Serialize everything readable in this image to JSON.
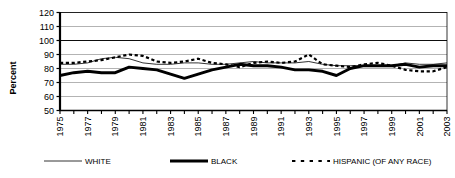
{
  "chart_data": {
    "type": "line",
    "title": "",
    "xlabel": "",
    "ylabel": "Percent",
    "ylim": [
      50,
      120
    ],
    "ytick_step": 10,
    "yticks": [
      "50",
      "60",
      "70",
      "80",
      "90",
      "100",
      "110",
      "120"
    ],
    "xlim": [
      1975,
      2003
    ],
    "xticks_all_years": [
      1975,
      1976,
      1977,
      1978,
      1979,
      1980,
      1981,
      1982,
      1983,
      1984,
      1985,
      1986,
      1987,
      1988,
      1989,
      1990,
      1991,
      1992,
      1993,
      1994,
      1995,
      1996,
      1997,
      1998,
      1999,
      2000,
      2001,
      2002,
      2003
    ],
    "xtick_labels": [
      "1975",
      "1977",
      "1979",
      "1981",
      "1983",
      "1985",
      "1987",
      "1989",
      "1991",
      "1993",
      "1995",
      "1997",
      "1999",
      "2001",
      "2003"
    ],
    "grid": true,
    "grid_axis": "y",
    "legend_position": "bottom",
    "x": [
      1975,
      1976,
      1977,
      1978,
      1979,
      1980,
      1981,
      1982,
      1983,
      1984,
      1985,
      1986,
      1987,
      1988,
      1989,
      1990,
      1991,
      1992,
      1993,
      1994,
      1995,
      1996,
      1997,
      1998,
      1999,
      2000,
      2001,
      2002,
      2003
    ],
    "series": [
      {
        "name": "WHITE",
        "style": "thin-solid",
        "color": "#000000",
        "values": [
          83,
          83,
          84,
          87,
          88,
          87,
          84,
          83,
          83,
          84,
          84,
          83,
          83,
          84,
          85,
          84,
          84,
          84,
          85,
          83,
          82,
          82,
          82,
          82,
          82,
          84,
          83,
          83,
          84
        ]
      },
      {
        "name": "BLACK",
        "style": "thick-solid",
        "color": "#000000",
        "values": [
          75,
          77,
          78,
          77,
          77,
          81,
          80,
          79,
          76,
          73,
          76,
          79,
          81,
          83,
          82,
          82,
          81,
          79,
          79,
          78,
          75,
          80,
          82,
          82,
          82,
          83,
          81,
          82,
          82
        ]
      },
      {
        "name": "HISPANIC (OF ANY RACE)",
        "style": "dashed",
        "color": "#000000",
        "values": [
          84,
          84,
          85,
          86,
          88,
          90,
          89,
          85,
          84,
          85,
          87,
          84,
          83,
          81,
          84,
          85,
          84,
          85,
          90,
          83,
          82,
          81,
          83,
          84,
          82,
          79,
          78,
          78,
          81
        ]
      }
    ]
  },
  "legend": {
    "items": [
      {
        "label": "WHITE",
        "swatch": "thin-solid"
      },
      {
        "label": "BLACK",
        "swatch": "thick-solid"
      },
      {
        "label": "HISPANIC (OF ANY RACE)",
        "swatch": "dashed"
      }
    ]
  }
}
